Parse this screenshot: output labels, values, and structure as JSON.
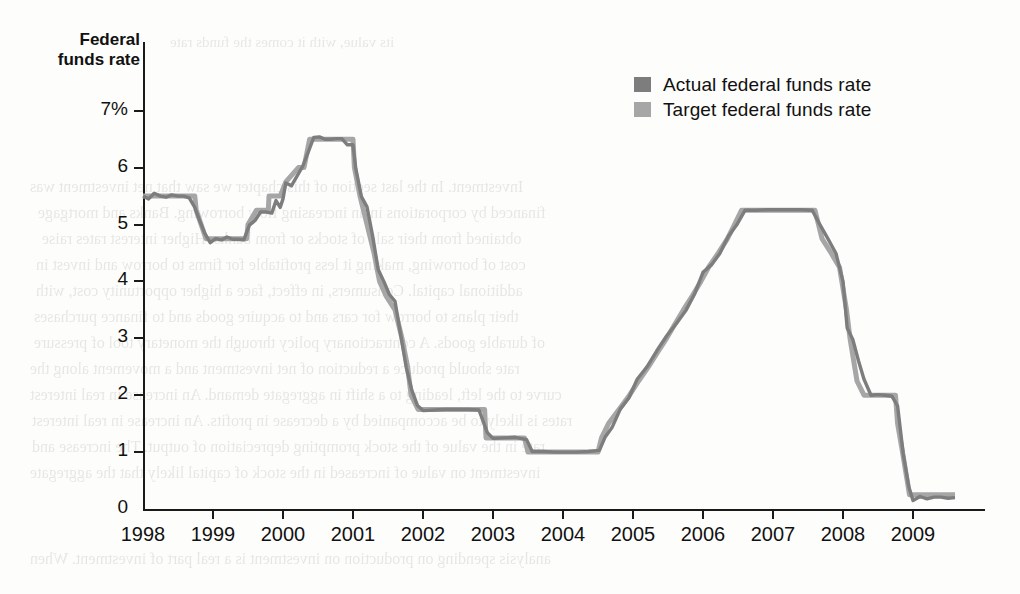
{
  "figure": {
    "axis_title": "Federal funds rate",
    "y_axis": {
      "ticks": [
        "7%",
        "6",
        "5",
        "4",
        "3",
        "2",
        "1",
        "0"
      ],
      "values": [
        7,
        6,
        5,
        4,
        3,
        2,
        1,
        0
      ]
    },
    "x_axis": {
      "ticks": [
        "1998",
        "1999",
        "2000",
        "2001",
        "2002",
        "2003",
        "2004",
        "2005",
        "2006",
        "2007",
        "2008",
        "2009"
      ]
    },
    "legend": [
      {
        "label": "Actual federal funds rate",
        "color": "#7d7d7d"
      },
      {
        "label": "Target federal funds rate",
        "color": "#a6a6a6"
      }
    ],
    "colors": {
      "actual": "#7d7d7d",
      "target": "#a6a6a6",
      "axis": "#1a1a1a",
      "text": "#111111",
      "background": "#fdfdfc"
    }
  },
  "bleed_text": [
    {
      "text": "its value, with it comes the funds rate",
      "x": 170,
      "y": 34,
      "size": 15
    },
    {
      "text": "Investment. In the last section of this chapter we saw that net investment was",
      "x": 30,
      "y": 178,
      "size": 16
    },
    {
      "text": "financed by corporations in an increasing flow borrowing. Banks and mortgage",
      "x": 38,
      "y": 204,
      "size": 16
    },
    {
      "text": "obtained from their sale of stocks or from banks. Higher interest rates raise",
      "x": 42,
      "y": 230,
      "size": 16
    },
    {
      "text": "cost of borrowing, making it less profitable for firms to borrow and invest in",
      "x": 36,
      "y": 256,
      "size": 16
    },
    {
      "text": "additional capital. Consumers, in effect, face a higher opportunity cost, with",
      "x": 36,
      "y": 282,
      "size": 16
    },
    {
      "text": "their plans to borrow for cars and to acquire goods and to finance purchases",
      "x": 34,
      "y": 308,
      "size": 16
    },
    {
      "text": "of durable goods. A contractionary policy through the monetary tool of pressure",
      "x": 34,
      "y": 334,
      "size": 16
    },
    {
      "text": "rate should produce a reduction of net investment and a movement along the",
      "x": 30,
      "y": 360,
      "size": 16
    },
    {
      "text": "curve to the left, leading to a shift in aggregate demand. An increase in real interest",
      "x": 30,
      "y": 386,
      "size": 16
    },
    {
      "text": "rates is likely to be accompanied by a decrease in profits. An increase in real interest",
      "x": 32,
      "y": 412,
      "size": 16
    },
    {
      "text": "rate in the value of the stock prompting depreciation of output. The increase and",
      "x": 32,
      "y": 438,
      "size": 16
    },
    {
      "text": "investment on value of increased in the stock of capital likely that the aggregate",
      "x": 30,
      "y": 464,
      "size": 16
    },
    {
      "text": "analysis spending on production on investment is a real part of investment. When",
      "x": 30,
      "y": 550,
      "size": 16
    }
  ],
  "chart_data": {
    "type": "line",
    "title": "Federal funds rate",
    "xlabel": "",
    "ylabel": "Federal funds rate",
    "xlim": [
      1998,
      2009.6
    ],
    "ylim": [
      0,
      7
    ],
    "grid": false,
    "legend_position": "top-right",
    "x_tick_labels": [
      "1998",
      "1999",
      "2000",
      "2001",
      "2002",
      "2003",
      "2004",
      "2005",
      "2006",
      "2007",
      "2008",
      "2009"
    ],
    "y_tick_labels": [
      "0",
      "1",
      "2",
      "3",
      "4",
      "5",
      "6",
      "7%"
    ],
    "series": [
      {
        "name": "Target federal funds rate",
        "color": "#a6a6a6",
        "points": [
          [
            1998.0,
            5.5
          ],
          [
            1998.2,
            5.5
          ],
          [
            1998.45,
            5.5
          ],
          [
            1998.74,
            5.5
          ],
          [
            1998.76,
            5.25
          ],
          [
            1998.83,
            5.0
          ],
          [
            1998.9,
            4.75
          ],
          [
            1999.0,
            4.75
          ],
          [
            1999.2,
            4.75
          ],
          [
            1999.48,
            4.75
          ],
          [
            1999.5,
            5.0
          ],
          [
            1999.62,
            5.25
          ],
          [
            1999.79,
            5.25
          ],
          [
            1999.8,
            5.5
          ],
          [
            1999.96,
            5.5
          ],
          [
            2000.04,
            5.75
          ],
          [
            2000.22,
            6.0
          ],
          [
            2000.3,
            6.0
          ],
          [
            2000.38,
            6.5
          ],
          [
            2000.5,
            6.5
          ],
          [
            2000.75,
            6.5
          ],
          [
            2001.0,
            6.5
          ],
          [
            2001.02,
            6.0
          ],
          [
            2001.1,
            5.5
          ],
          [
            2001.2,
            5.0
          ],
          [
            2001.3,
            4.5
          ],
          [
            2001.38,
            4.0
          ],
          [
            2001.47,
            3.75
          ],
          [
            2001.6,
            3.5
          ],
          [
            2001.7,
            3.0
          ],
          [
            2001.78,
            2.5
          ],
          [
            2001.83,
            2.0
          ],
          [
            2001.93,
            1.75
          ],
          [
            2002.0,
            1.75
          ],
          [
            2002.5,
            1.75
          ],
          [
            2002.88,
            1.75
          ],
          [
            2002.9,
            1.25
          ],
          [
            2003.0,
            1.25
          ],
          [
            2003.45,
            1.25
          ],
          [
            2003.5,
            1.0
          ],
          [
            2003.8,
            1.0
          ],
          [
            2004.0,
            1.0
          ],
          [
            2004.3,
            1.0
          ],
          [
            2004.5,
            1.0
          ],
          [
            2004.55,
            1.25
          ],
          [
            2004.65,
            1.5
          ],
          [
            2004.8,
            1.75
          ],
          [
            2004.95,
            2.0
          ],
          [
            2005.08,
            2.25
          ],
          [
            2005.22,
            2.5
          ],
          [
            2005.35,
            2.75
          ],
          [
            2005.48,
            3.0
          ],
          [
            2005.6,
            3.25
          ],
          [
            2005.72,
            3.5
          ],
          [
            2005.85,
            3.75
          ],
          [
            2005.97,
            4.0
          ],
          [
            2006.08,
            4.25
          ],
          [
            2006.22,
            4.5
          ],
          [
            2006.35,
            4.75
          ],
          [
            2006.45,
            5.0
          ],
          [
            2006.55,
            5.25
          ],
          [
            2006.8,
            5.25
          ],
          [
            2007.0,
            5.25
          ],
          [
            2007.3,
            5.25
          ],
          [
            2007.6,
            5.25
          ],
          [
            2007.7,
            4.75
          ],
          [
            2007.83,
            4.5
          ],
          [
            2007.95,
            4.25
          ],
          [
            2008.05,
            3.5
          ],
          [
            2008.1,
            3.0
          ],
          [
            2008.2,
            2.25
          ],
          [
            2008.3,
            2.0
          ],
          [
            2008.45,
            2.0
          ],
          [
            2008.6,
            2.0
          ],
          [
            2008.75,
            2.0
          ],
          [
            2008.78,
            1.5
          ],
          [
            2008.85,
            1.0
          ],
          [
            2008.95,
            0.25
          ],
          [
            2009.0,
            0.25
          ],
          [
            2009.3,
            0.25
          ],
          [
            2009.6,
            0.25
          ]
        ]
      },
      {
        "name": "Actual federal funds rate",
        "color": "#7d7d7d",
        "points": [
          [
            1998.0,
            5.5
          ],
          [
            1998.08,
            5.45
          ],
          [
            1998.16,
            5.55
          ],
          [
            1998.25,
            5.5
          ],
          [
            1998.33,
            5.48
          ],
          [
            1998.41,
            5.52
          ],
          [
            1998.5,
            5.5
          ],
          [
            1998.58,
            5.5
          ],
          [
            1998.66,
            5.47
          ],
          [
            1998.74,
            5.3
          ],
          [
            1998.8,
            5.1
          ],
          [
            1998.88,
            4.85
          ],
          [
            1998.96,
            4.68
          ],
          [
            1999.04,
            4.75
          ],
          [
            1999.12,
            4.73
          ],
          [
            1999.2,
            4.78
          ],
          [
            1999.28,
            4.74
          ],
          [
            1999.36,
            4.74
          ],
          [
            1999.44,
            4.73
          ],
          [
            1999.52,
            4.99
          ],
          [
            1999.6,
            5.07
          ],
          [
            1999.68,
            5.22
          ],
          [
            1999.76,
            5.22
          ],
          [
            1999.84,
            5.2
          ],
          [
            1999.9,
            5.42
          ],
          [
            1999.96,
            5.3
          ],
          [
            2000.0,
            5.45
          ],
          [
            2000.04,
            5.73
          ],
          [
            2000.12,
            5.68
          ],
          [
            2000.2,
            5.85
          ],
          [
            2000.28,
            6.02
          ],
          [
            2000.36,
            6.27
          ],
          [
            2000.44,
            6.53
          ],
          [
            2000.52,
            6.54
          ],
          [
            2000.6,
            6.5
          ],
          [
            2000.68,
            6.5
          ],
          [
            2000.76,
            6.51
          ],
          [
            2000.84,
            6.51
          ],
          [
            2000.92,
            6.4
          ],
          [
            2001.0,
            6.4
          ],
          [
            2001.04,
            5.98
          ],
          [
            2001.12,
            5.49
          ],
          [
            2001.2,
            5.31
          ],
          [
            2001.28,
            4.8
          ],
          [
            2001.36,
            4.21
          ],
          [
            2001.44,
            4.0
          ],
          [
            2001.52,
            3.77
          ],
          [
            2001.6,
            3.65
          ],
          [
            2001.68,
            3.07
          ],
          [
            2001.76,
            2.49
          ],
          [
            2001.84,
            2.09
          ],
          [
            2001.92,
            1.82
          ],
          [
            2002.0,
            1.73
          ],
          [
            2002.16,
            1.74
          ],
          [
            2002.32,
            1.75
          ],
          [
            2002.48,
            1.75
          ],
          [
            2002.64,
            1.75
          ],
          [
            2002.8,
            1.74
          ],
          [
            2002.92,
            1.34
          ],
          [
            2003.0,
            1.24
          ],
          [
            2003.16,
            1.25
          ],
          [
            2003.32,
            1.26
          ],
          [
            2003.48,
            1.22
          ],
          [
            2003.56,
            1.01
          ],
          [
            2003.72,
            1.01
          ],
          [
            2003.88,
            1.0
          ],
          [
            2004.04,
            1.0
          ],
          [
            2004.2,
            1.0
          ],
          [
            2004.36,
            1.01
          ],
          [
            2004.52,
            1.03
          ],
          [
            2004.6,
            1.26
          ],
          [
            2004.7,
            1.43
          ],
          [
            2004.82,
            1.76
          ],
          [
            2004.94,
            1.95
          ],
          [
            2005.06,
            2.28
          ],
          [
            2005.2,
            2.5
          ],
          [
            2005.34,
            2.78
          ],
          [
            2005.48,
            3.04
          ],
          [
            2005.62,
            3.26
          ],
          [
            2005.76,
            3.5
          ],
          [
            2005.88,
            3.78
          ],
          [
            2006.0,
            4.16
          ],
          [
            2006.12,
            4.29
          ],
          [
            2006.24,
            4.49
          ],
          [
            2006.36,
            4.79
          ],
          [
            2006.48,
            4.99
          ],
          [
            2006.6,
            5.25
          ],
          [
            2006.76,
            5.25
          ],
          [
            2006.92,
            5.26
          ],
          [
            2007.08,
            5.26
          ],
          [
            2007.24,
            5.26
          ],
          [
            2007.4,
            5.26
          ],
          [
            2007.56,
            5.25
          ],
          [
            2007.66,
            5.02
          ],
          [
            2007.78,
            4.76
          ],
          [
            2007.9,
            4.49
          ],
          [
            2008.0,
            4.0
          ],
          [
            2008.06,
            3.18
          ],
          [
            2008.14,
            2.98
          ],
          [
            2008.22,
            2.61
          ],
          [
            2008.3,
            2.28
          ],
          [
            2008.4,
            2.0
          ],
          [
            2008.5,
            2.01
          ],
          [
            2008.6,
            2.0
          ],
          [
            2008.7,
            1.98
          ],
          [
            2008.78,
            1.81
          ],
          [
            2008.86,
            0.97
          ],
          [
            2008.94,
            0.39
          ],
          [
            2009.0,
            0.15
          ],
          [
            2009.1,
            0.22
          ],
          [
            2009.2,
            0.18
          ],
          [
            2009.3,
            0.21
          ],
          [
            2009.4,
            0.21
          ],
          [
            2009.5,
            0.19
          ],
          [
            2009.6,
            0.2
          ]
        ]
      }
    ]
  }
}
